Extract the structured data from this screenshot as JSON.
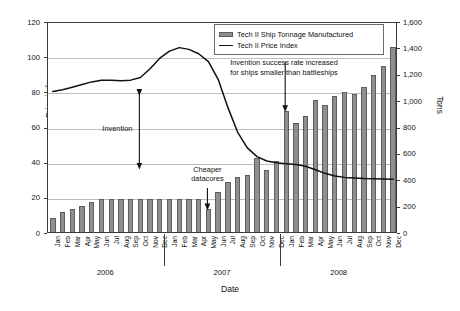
{
  "chart_data": {
    "type": "bar",
    "title": "",
    "xlabel": "Date",
    "ylabel": "Price index",
    "y2label": "Tons",
    "ylim": [
      0,
      120
    ],
    "y2lim": [
      0,
      1600
    ],
    "grid": true,
    "legend_position": "top-center",
    "yticks": [
      "0",
      "20",
      "40",
      "60",
      "80",
      "100",
      "120"
    ],
    "y2ticks": [
      "0",
      "200",
      "400",
      "600",
      "800",
      "1,000",
      "1,200",
      "1,400",
      "1,600"
    ],
    "year_groups": [
      {
        "label": "2006",
        "months": 12
      },
      {
        "label": "2007",
        "months": 12
      },
      {
        "label": "2008",
        "months": 12
      }
    ],
    "categories": [
      "Jan",
      "Feb",
      "Mar",
      "Apr",
      "May",
      "Jun",
      "Jul",
      "Aug",
      "Sep",
      "Oct",
      "Nov",
      "Dec",
      "Jan",
      "Feb",
      "Mar",
      "Apr",
      "May",
      "Jun",
      "Jul",
      "Aug",
      "Sep",
      "Oct",
      "Nov",
      "Dec",
      "Jan",
      "Feb",
      "Mar",
      "Apr",
      "May",
      "Jun",
      "Jul",
      "Aug",
      "Sep",
      "Oct",
      "Nov",
      "Dec"
    ],
    "series": [
      {
        "name": "Tech II Ship Tonnage Manufactured",
        "axis": "right",
        "unit": "Tons",
        "type": "bar",
        "color": "#8f8f8f",
        "values": [
          105,
          150,
          175,
          200,
          225,
          250,
          250,
          250,
          250,
          250,
          250,
          250,
          250,
          250,
          250,
          250,
          175,
          300,
          380,
          420,
          430,
          560,
          470,
          540,
          920,
          830,
          880,
          1000,
          960,
          1030,
          1060,
          1050,
          1100,
          1190,
          1260,
          1400
        ]
      },
      {
        "name": "Tech II Price Index",
        "axis": "left",
        "unit": "index",
        "type": "line",
        "color": "#111111",
        "values": [
          81,
          82,
          83.5,
          85,
          86.5,
          87.5,
          87.5,
          87.2,
          87.5,
          89,
          94,
          100,
          104,
          106,
          105,
          102.5,
          98,
          88,
          72,
          58,
          49,
          44,
          41.5,
          40.5,
          40,
          39.5,
          38.5,
          36.5,
          34.5,
          33,
          32.2,
          31.8,
          31.5,
          31.4,
          31.3,
          31.2
        ]
      }
    ],
    "annotations": [
      {
        "id": "invention",
        "label": "Invention",
        "marker": "double-headed-vertical-arrow",
        "at_category": "Oct 2006"
      },
      {
        "id": "cheaper-datacores",
        "label": "Cheaper\ndatacores",
        "line1": "Cheaper",
        "line2": "datacores",
        "marker": "down-arrow",
        "at_category": "May 2007"
      },
      {
        "id": "invention-success-rate",
        "line1": "Invention success rate increased",
        "line2": "for ships smaller than battleships",
        "marker": "down-arrow",
        "at_category": "Jan 2008"
      }
    ]
  },
  "legend": {
    "items": [
      {
        "label": "Tech II Ship Tonnage Manufactured",
        "swatch": "bar"
      },
      {
        "label": "Tech II Price Index",
        "swatch": "line"
      }
    ]
  }
}
